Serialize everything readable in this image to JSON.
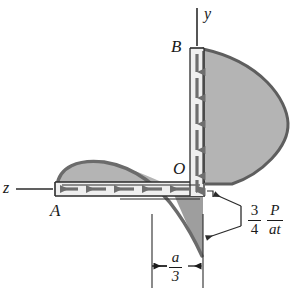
{
  "figure": {
    "kind": "shear-flow-diagram",
    "background": "#ffffff",
    "fill_color": "#b4b4b4",
    "outline_color": "#5e5e5e",
    "line_color": "#1a1a1a",
    "arrow_color": "#6b6b6b"
  },
  "labels": {
    "point_a": "A",
    "point_b": "B",
    "origin": "O",
    "axis_y": "y",
    "axis_z": "z"
  },
  "annotations": {
    "peak_value": {
      "coefficient_numerator": "3",
      "coefficient_denominator": "4",
      "quantity_numerator": "P",
      "quantity_denominator": "at"
    },
    "dimension": {
      "numerator": "a",
      "denominator": "3"
    }
  }
}
